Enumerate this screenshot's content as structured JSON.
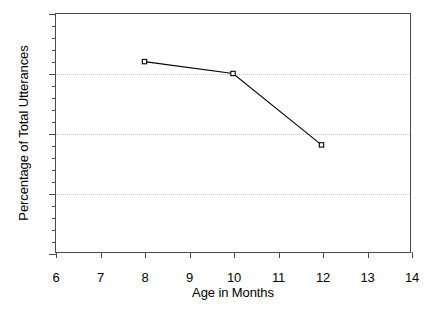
{
  "chart_data": {
    "type": "line",
    "title": "",
    "xlabel": "Age in Months",
    "ylabel": "Percentage of Total Utterances",
    "xlim": [
      6,
      14
    ],
    "ylim": [
      0,
      20
    ],
    "x_ticks": [
      6,
      7,
      8,
      9,
      10,
      11,
      12,
      13,
      14
    ],
    "y_ticks": [
      0,
      5,
      10,
      15,
      20
    ],
    "y_minor_tick_step": 1,
    "grid": {
      "horizontal": true,
      "vertical": false,
      "style": "dotted",
      "at": [
        5,
        10,
        15
      ]
    },
    "legend": null,
    "series": [
      {
        "name": "",
        "marker": "open-square",
        "line_color": "#000000",
        "x": [
          8,
          10,
          12
        ],
        "values": [
          16,
          15,
          9
        ],
        "points": [
          {
            "x": 8,
            "y": 16
          },
          {
            "x": 10,
            "y": 15
          },
          {
            "x": 12,
            "y": 9
          }
        ]
      }
    ]
  },
  "axes": {
    "x_tick_labels": [
      "6",
      "7",
      "8",
      "9",
      "10",
      "11",
      "12",
      "13",
      "14"
    ],
    "y_tick_labels": [
      "0",
      "5",
      "10",
      "15",
      "20"
    ],
    "x_title": "Age in Months",
    "y_title": "Percentage of Total Utterances"
  },
  "colors": {
    "axis": "#4a4a4a",
    "grid": "#c9c9c9",
    "series_line": "#000000",
    "background": "#ffffff"
  }
}
